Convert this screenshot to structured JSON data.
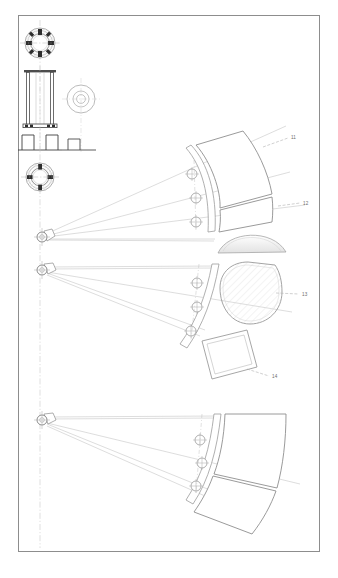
{
  "sheet": {
    "title": "Technical patent drawing sheet",
    "background_color": "#ffffff",
    "border_color": "#8d8d8d",
    "line_color": "#9a9a9a",
    "dark_line_color": "#4c4c4c",
    "hatch_fill": "#efefef",
    "shade_fill": "#e6e6e6",
    "border": {
      "x": 18,
      "y": 15,
      "width": 302,
      "height": 537
    }
  },
  "reference_labels": [
    {
      "id": "label-11",
      "text": "11",
      "x": 291,
      "y": 138
    },
    {
      "id": "label-12",
      "text": "12",
      "x": 303,
      "y": 203
    },
    {
      "id": "label-13",
      "text": "13",
      "x": 302,
      "y": 294
    },
    {
      "id": "label-14",
      "text": "14",
      "x": 272,
      "y": 376
    }
  ],
  "leader_lines": [
    {
      "id": "leader-11",
      "x1": 263,
      "y1": 147,
      "x2": 288,
      "y2": 138
    },
    {
      "id": "leader-12",
      "x1": 278,
      "y1": 206,
      "x2": 300,
      "y2": 203
    },
    {
      "id": "leader-13",
      "x1": 276,
      "y1": 293,
      "x2": 299,
      "y2": 294
    },
    {
      "id": "leader-14",
      "x1": 247,
      "y1": 369,
      "x2": 269,
      "y2": 376
    }
  ],
  "detail_views": {
    "top_flange": {
      "name": "bolted-circular-flange-top",
      "cx": 40,
      "cy": 43,
      "outer_r": 15,
      "inner_r": 9.5,
      "bolt_count": 8
    },
    "column_elevation": {
      "name": "column-elevation",
      "x": 24,
      "y": 70,
      "width": 32,
      "height": 62,
      "base_plate_y": 124
    },
    "washer_plan": {
      "name": "washer-plan-view",
      "cx": 81,
      "cy": 99,
      "radii": [
        14,
        8,
        4.5
      ]
    },
    "small_base_profile": {
      "name": "small-base-profile",
      "x": 68,
      "y": 138,
      "width": 28,
      "height": 12
    },
    "bottom_flange": {
      "name": "bolted-circular-flange-bottom",
      "cx": 40,
      "cy": 177,
      "outer_r": 14,
      "inner_r": 9,
      "bolt_count": 8
    }
  },
  "fan_assemblies": [
    {
      "id": "fan-assembly-upper",
      "pivot": {
        "cx": 42,
        "cy": 237,
        "r": 5
      },
      "arc_center_x": 210,
      "node_points": [
        {
          "cx": 192,
          "cy": 174,
          "r": 5
        },
        {
          "cx": 196,
          "cy": 198,
          "r": 5
        },
        {
          "cx": 196,
          "cy": 222,
          "r": 5
        }
      ],
      "panel_label_ids": [
        "11",
        "12"
      ]
    },
    {
      "id": "fan-assembly-middle",
      "pivot": {
        "cx": 42,
        "cy": 270,
        "r": 5
      },
      "arc_center_x": 212,
      "node_points": [
        {
          "cx": 197,
          "cy": 283,
          "r": 5
        },
        {
          "cx": 197,
          "cy": 307,
          "r": 5
        },
        {
          "cx": 191,
          "cy": 331,
          "r": 5
        }
      ],
      "panel_label_ids": [
        "13",
        "14"
      ]
    },
    {
      "id": "fan-assembly-lower",
      "pivot": {
        "cx": 42,
        "cy": 420,
        "r": 5
      },
      "arc_center_x": 214,
      "node_points": [
        {
          "cx": 200,
          "cy": 440,
          "r": 5
        },
        {
          "cx": 202,
          "cy": 463,
          "r": 5
        },
        {
          "cx": 196,
          "cy": 486,
          "r": 5
        }
      ],
      "panel_label_ids": []
    }
  ],
  "components": {
    "dome": {
      "name": "shallow-dome-profile",
      "cx": 252,
      "cy": 240,
      "rx": 34,
      "ry": 14
    },
    "hatched_disc": {
      "name": "hatched-flattened-disc",
      "cx": 250,
      "cy": 293,
      "r": 32
    },
    "tilted_panel": {
      "name": "tilted-rectangular-panel",
      "cx": 228,
      "cy": 352
    }
  },
  "center_line": {
    "name": "vertical-center-line",
    "x": 40,
    "top": 20,
    "bottom": 548
  }
}
